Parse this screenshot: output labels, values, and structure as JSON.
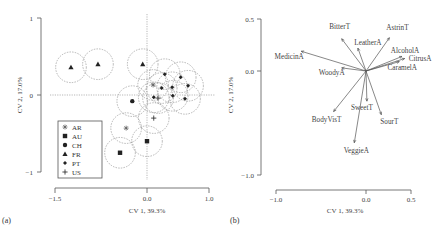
{
  "chart_data": [
    {
      "panel": "(a)",
      "type": "scatter",
      "title": "",
      "xlabel": "CV 1, 39.3%",
      "ylabel": "CV 2, 17.0%",
      "xlim": [
        -1.5,
        1.0
      ],
      "ylim": [
        -1,
        1
      ],
      "xticks": [
        "-1.5",
        "0.0",
        "1.0"
      ],
      "yticks": [
        "1",
        "0",
        "-1"
      ],
      "grid": false,
      "reference_lines": {
        "x": 0,
        "y": 0,
        "style": "dotted"
      },
      "confidence_circle_radius": 0.25,
      "legend_position": "lower-left inside",
      "series": [
        {
          "name": "AR",
          "marker": "asterisk",
          "points": [
            [
              -0.34,
              -0.43
            ],
            [
              0.1,
              0.13
            ]
          ]
        },
        {
          "name": "AU",
          "marker": "square",
          "points": [
            [
              -0.44,
              -0.75
            ],
            [
              0.0,
              -0.6
            ]
          ]
        },
        {
          "name": "CH",
          "marker": "circle",
          "points": [
            [
              -0.24,
              -0.08
            ]
          ]
        },
        {
          "name": "FR",
          "marker": "triangle",
          "points": [
            [
              -1.24,
              0.36
            ],
            [
              -0.8,
              0.4
            ],
            [
              -0.07,
              0.4
            ]
          ]
        },
        {
          "name": "PT",
          "marker": "diamond",
          "points": [
            [
              0.29,
              0.27
            ],
            [
              0.55,
              0.23
            ],
            [
              0.67,
              0.12
            ],
            [
              0.41,
              0.1
            ],
            [
              0.24,
              0.09
            ],
            [
              0.11,
              -0.03
            ],
            [
              0.42,
              -0.01
            ],
            [
              0.62,
              -0.05
            ]
          ]
        },
        {
          "name": "US",
          "marker": "plus",
          "points": [
            [
              0.11,
              -0.3
            ],
            [
              0.18,
              -0.04
            ]
          ]
        }
      ]
    },
    {
      "panel": "(b)",
      "type": "biplot-vectors",
      "title": "",
      "xlabel": "CV 1, 39.3%",
      "ylabel": "CV 2, 17.0%",
      "xlim": [
        -1.0,
        0.5
      ],
      "ylim": [
        -1.0,
        0.5
      ],
      "xticks": [
        "-1.0",
        "0.0",
        "0.5"
      ],
      "yticks": [
        "0.5",
        "0.0",
        "-1.0"
      ],
      "grid": false,
      "vectors": [
        {
          "name": "BitterT",
          "x": -0.27,
          "y": 0.31
        },
        {
          "name": "LeatherA",
          "x": -0.09,
          "y": 0.22
        },
        {
          "name": "AstrinT",
          "x": 0.26,
          "y": 0.32
        },
        {
          "name": "AlcoholA",
          "x": 0.4,
          "y": 0.14
        },
        {
          "name": "CitrusA",
          "x": 0.43,
          "y": 0.12
        },
        {
          "name": "CaramelA",
          "x": 0.37,
          "y": 0.09
        },
        {
          "name": "MedicinA",
          "x": -0.72,
          "y": 0.19
        },
        {
          "name": "WoodyA",
          "x": -0.27,
          "y": 0.03
        },
        {
          "name": "SweetT",
          "x": 0.01,
          "y": -0.29
        },
        {
          "name": "SourT",
          "x": 0.17,
          "y": -0.42
        },
        {
          "name": "BodyVisT",
          "x": -0.36,
          "y": -0.39
        },
        {
          "name": "VeggieA",
          "x": -0.13,
          "y": -0.69
        }
      ]
    }
  ],
  "panel_a": {
    "label": "(a)",
    "xlabel": "CV 1, 39.3%",
    "ylabel": "CV 2, 17.0%",
    "xticks": [
      "-1.5",
      "0.0",
      "1.0"
    ],
    "yticks": [
      "1",
      "0",
      "-1"
    ],
    "legend": [
      {
        "symbol": "✱",
        "name": "AR"
      },
      {
        "symbol": "■",
        "name": "AU"
      },
      {
        "symbol": "●",
        "name": "CH"
      },
      {
        "symbol": "▲",
        "name": "FR"
      },
      {
        "symbol": "◆",
        "name": "PT"
      },
      {
        "symbol": "+",
        "name": "US"
      }
    ]
  },
  "panel_b": {
    "label": "(b)",
    "xlabel": "CV 1, 39.3%",
    "ylabel": "CV 2, 17.0%",
    "xticks": [
      "-1.0",
      "0.0",
      "0.5"
    ],
    "yticks": [
      "0.5",
      "0.0",
      "-1.0"
    ]
  }
}
